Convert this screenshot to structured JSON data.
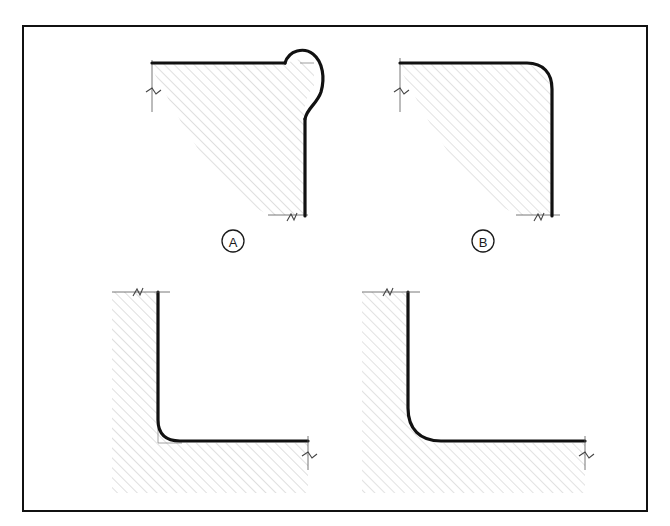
{
  "page": {
    "width": 670,
    "height": 526,
    "background": "#ffffff",
    "kind": "engineering-detail-drawing"
  },
  "frame": {
    "stroke": "#111111",
    "stroke_width": 2.5,
    "x": 22,
    "y": 25,
    "width": 626,
    "height": 487
  },
  "style": {
    "outline_color": "#111111",
    "outline_width": 3.2,
    "thin_line_color": "#4a4a4a",
    "thin_line_width": 0.8,
    "hatch_color": "#b9b9b9",
    "hatch_width": 0.9,
    "hatch_angle_deg": 45,
    "hatch_spacing": 7,
    "label_color": "#1a1a1a",
    "label_font_size": 13
  },
  "details": [
    {
      "id": "detail-a",
      "label": "A",
      "label_x": 233,
      "label_y": 241,
      "title": "outside corner with excess material bulge",
      "corner_type": "convex-overfill",
      "has_label": true,
      "break_marks": 2,
      "nominal_corner_x": 300,
      "nominal_corner_y": 63
    },
    {
      "id": "detail-b",
      "label": "B",
      "label_x": 483,
      "label_y": 241,
      "title": "outside corner with clean fillet radius",
      "corner_type": "convex-radius",
      "has_label": true,
      "break_marks": 2,
      "nominal_corner_x": 548,
      "nominal_corner_y": 63
    },
    {
      "id": "detail-c",
      "label": "",
      "label_x": 0,
      "label_y": 0,
      "title": "inside corner with small fillet and surrounding material",
      "corner_type": "concave-small-radius",
      "has_label": false,
      "break_marks": 2,
      "nominal_corner_x": 160,
      "nominal_corner_y": 442
    },
    {
      "id": "detail-d",
      "label": "",
      "label_x": 0,
      "label_y": 0,
      "title": "inside corner with large fillet and surrounding material",
      "corner_type": "concave-large-radius",
      "has_label": false,
      "break_marks": 2,
      "nominal_corner_x": 410,
      "nominal_corner_y": 442
    }
  ]
}
